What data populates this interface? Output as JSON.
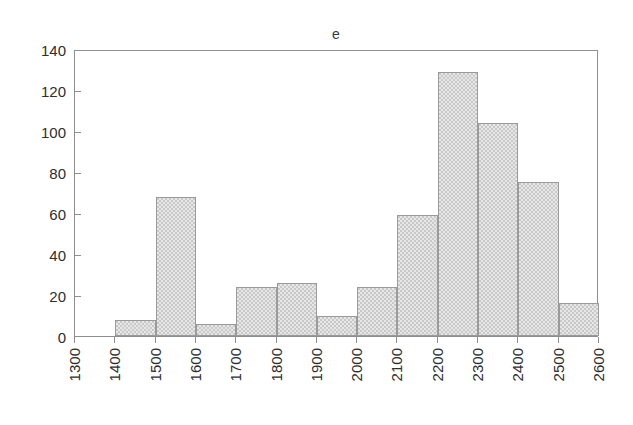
{
  "chart_data": {
    "type": "bar",
    "title": "e",
    "xlabel": "",
    "ylabel": "",
    "grid": false,
    "legend": null,
    "bin_width": 100,
    "xlim": [
      1300,
      2600
    ],
    "ylim": [
      0,
      140
    ],
    "x_tick_labels": [
      "1300",
      "1400",
      "1500",
      "1600",
      "1700",
      "1800",
      "1900",
      "2000",
      "2100",
      "2200",
      "2300",
      "2400",
      "2500",
      "2600"
    ],
    "y_tick_labels": [
      "0",
      "20",
      "40",
      "60",
      "80",
      "100",
      "120",
      "140"
    ],
    "y_ticks": [
      0,
      20,
      40,
      60,
      80,
      100,
      120,
      140
    ],
    "categories": [
      "1300-1400",
      "1400-1500",
      "1500-1600",
      "1600-1700",
      "1700-1800",
      "1800-1900",
      "1900-2000",
      "2000-2100",
      "2100-2200",
      "2200-2300",
      "2300-2400",
      "2400-2500",
      "2500-2600"
    ],
    "bin_starts": [
      1300,
      1400,
      1500,
      1600,
      1700,
      1800,
      1900,
      2000,
      2100,
      2200,
      2300,
      2400,
      2500
    ],
    "values": [
      0,
      8,
      68,
      6,
      24,
      26,
      10,
      24,
      59,
      129,
      104,
      75,
      16
    ],
    "series": [
      {
        "name": "e",
        "values": [
          0,
          8,
          68,
          6,
          24,
          26,
          10,
          24,
          59,
          129,
          104,
          75,
          16
        ]
      }
    ],
    "colors": {
      "bar_fill": "#c9c9c9",
      "bar_border": "#9a9a9a",
      "axis": "#8e8e8e",
      "text": "#2e2e2e",
      "background": "#ffffff"
    }
  }
}
